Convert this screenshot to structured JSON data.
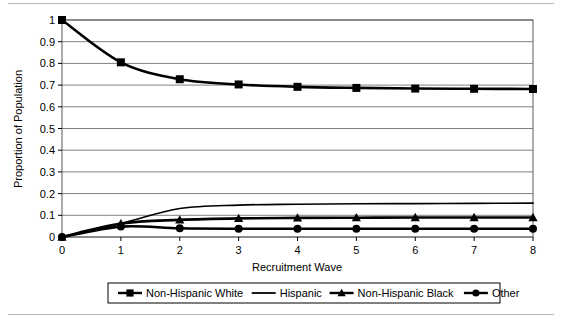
{
  "chart_data": {
    "type": "line",
    "title": "",
    "xlabel": "Recruitment Wave",
    "ylabel": "Proportion of Population",
    "x": [
      0,
      1,
      2,
      3,
      4,
      5,
      6,
      7,
      8
    ],
    "xlim": [
      0,
      8
    ],
    "ylim": [
      0,
      1
    ],
    "xticks": [
      "0",
      "1",
      "2",
      "3",
      "4",
      "5",
      "6",
      "7",
      "8"
    ],
    "yticks": [
      "0",
      "0.1",
      "0.2",
      "0.3",
      "0.4",
      "0.5",
      "0.6",
      "0.7",
      "0.8",
      "0.9",
      "1"
    ],
    "grid": "horizontal",
    "legend_position": "bottom",
    "series": [
      {
        "name": "Non-Hispanic White",
        "marker": "square",
        "values": [
          1.0,
          0.805,
          0.727,
          0.703,
          0.692,
          0.687,
          0.684,
          0.683,
          0.682
        ]
      },
      {
        "name": "Hispanic",
        "marker": "none",
        "values": [
          0.0,
          0.062,
          0.131,
          0.147,
          0.151,
          0.153,
          0.154,
          0.155,
          0.156
        ]
      },
      {
        "name": "Non-Hispanic Black",
        "marker": "triangle",
        "values": [
          0.0,
          0.062,
          0.079,
          0.086,
          0.088,
          0.089,
          0.09,
          0.09,
          0.09
        ]
      },
      {
        "name": "Other",
        "marker": "circle",
        "values": [
          0.0,
          0.048,
          0.04,
          0.038,
          0.038,
          0.038,
          0.038,
          0.038,
          0.038
        ]
      }
    ]
  },
  "legend": {
    "items": [
      {
        "label": "Non-Hispanic White",
        "marker": "square"
      },
      {
        "label": "Hispanic",
        "marker": "none"
      },
      {
        "label": "Non-Hispanic Black",
        "marker": "triangle"
      },
      {
        "label": "Other",
        "marker": "circle"
      }
    ]
  },
  "colors": {
    "series": "#000000",
    "grid": "#808080",
    "frame": "#595959",
    "rule": "#b9b9b9",
    "background": "#ffffff"
  }
}
